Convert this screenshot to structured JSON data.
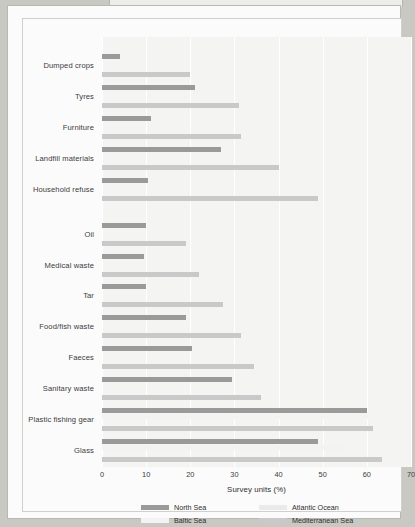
{
  "chart_data": {
    "type": "bar",
    "orientation": "horizontal",
    "title": "",
    "xlabel": "Survey units (%)",
    "ylabel": "",
    "xlim": [
      0,
      70
    ],
    "xticks": [
      0,
      10,
      20,
      30,
      40,
      50,
      60,
      70
    ],
    "grid": true,
    "legend_position": "bottom",
    "sections": [
      {
        "title": "Large litter items",
        "categories": [
          "Dumped crops",
          "Tyres",
          "Furniture",
          "Landfill materials",
          "Household refuse"
        ]
      },
      {
        "title": "Small litter items",
        "categories": [
          "Oil",
          "Medical waste",
          "Tar",
          "Food/fish waste",
          "Faeces",
          "Sanitary waste",
          "Plastic fishing gear",
          "Glass"
        ]
      }
    ],
    "categories": [
      "Dumped crops",
      "Tyres",
      "Furniture",
      "Landfill materials",
      "Household refuse",
      "Oil",
      "Medical waste",
      "Tar",
      "Food/fish waste",
      "Faeces",
      "Sanitary waste",
      "Plastic fishing gear",
      "Glass"
    ],
    "series": [
      {
        "name": "North Sea",
        "color": "#9a9a9a",
        "values": [
          4,
          21,
          11,
          27,
          10.5,
          10,
          9.5,
          10,
          19,
          20.5,
          29.5,
          60,
          49
        ]
      },
      {
        "name": "Baltic Sea",
        "color": "#f3f3f3",
        "values": [
          0,
          0,
          0,
          0,
          0,
          0,
          0,
          0,
          0,
          0,
          0,
          60.5,
          55.5
        ]
      },
      {
        "name": "Atlantic Ocean",
        "color": "#eaeaea",
        "values": [
          0,
          0,
          0,
          0,
          0,
          0,
          0,
          0,
          0,
          0,
          0,
          0,
          0
        ]
      },
      {
        "name": "Mediterranean Sea",
        "color": "#c9c9c9",
        "values": [
          20,
          31,
          31.5,
          40,
          49,
          19,
          22,
          27.5,
          31.5,
          34.5,
          36,
          61.5,
          63.5
        ]
      }
    ]
  },
  "legend": {
    "items": [
      {
        "label": "North Sea",
        "color": "#9a9a9a"
      },
      {
        "label": "Atlantic Ocean",
        "color": "#eaeaea"
      },
      {
        "label": "Baltic Sea",
        "color": "#f3f3f3"
      },
      {
        "label": "Mediterranean Sea",
        "color": "#c9c9c9"
      }
    ]
  },
  "axis": {
    "x_title": "Survey units (%)",
    "tick_labels": [
      "0",
      "10",
      "20",
      "30",
      "40",
      "50",
      "60",
      "70"
    ]
  },
  "section_titles": {
    "large": "Large litter items",
    "small": "Small litter items"
  }
}
